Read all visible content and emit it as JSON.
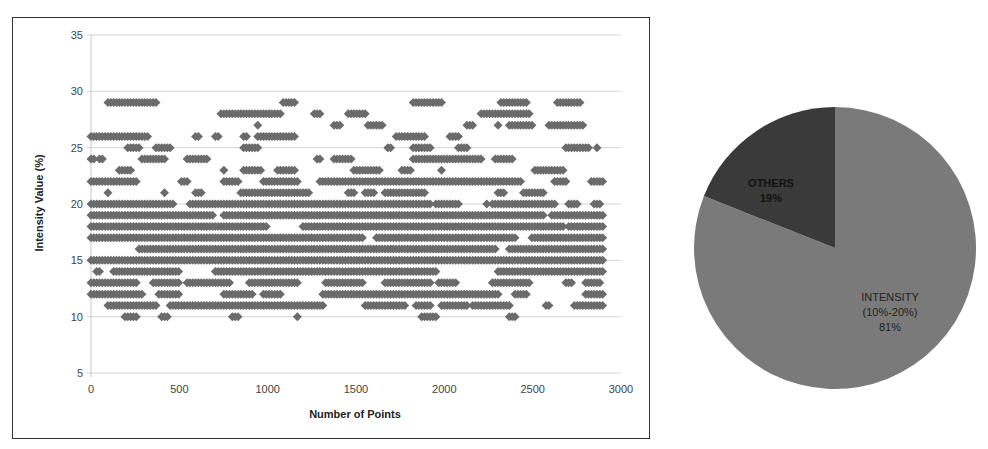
{
  "chart_data": [
    {
      "type": "scatter",
      "title": "",
      "xlabel": "Number of Points",
      "ylabel": "Intensity Value (%)",
      "xlim": [
        0,
        3000
      ],
      "ylim": [
        5,
        35
      ],
      "xticks": [
        "0",
        "500",
        "1000",
        "1500",
        "2000",
        "2500",
        "3000"
      ],
      "yticks": [
        "5",
        "10",
        "15",
        "20",
        "25",
        "30",
        "35"
      ],
      "grid": "horizontal",
      "marker": "diamond",
      "marker_color": "#6b6b6b",
      "series": [
        {
          "name": "Intensity",
          "description": "Integer intensity values (7-30%) for ~2900 points; dense bands 10-20%, sparse 21-30%",
          "rows": [
            {
              "y": 30,
              "density": 0.12,
              "x_range": [
                0,
                2600
              ]
            },
            {
              "y": 29,
              "density": 0.15,
              "x_range": [
                0,
                2850
              ]
            },
            {
              "y": 28,
              "density": 0.2,
              "x_range": [
                0,
                2800
              ]
            },
            {
              "y": 27,
              "density": 0.25,
              "x_range": [
                0,
                2850
              ]
            },
            {
              "y": 26,
              "density": 0.28,
              "x_range": [
                0,
                2800
              ]
            },
            {
              "y": 25,
              "density": 0.25,
              "x_range": [
                0,
                2900
              ]
            },
            {
              "y": 24,
              "density": 0.3,
              "x_range": [
                0,
                2850
              ]
            },
            {
              "y": 23,
              "density": 0.3,
              "x_range": [
                0,
                2850
              ]
            },
            {
              "y": 22,
              "density": 0.35,
              "x_range": [
                0,
                2900
              ]
            },
            {
              "y": 21,
              "density": 0.4,
              "x_range": [
                0,
                2850
              ]
            },
            {
              "y": 20,
              "density": 0.92,
              "x_range": [
                0,
                2900
              ]
            },
            {
              "y": 19,
              "density": 0.92,
              "x_range": [
                0,
                2900
              ]
            },
            {
              "y": 18,
              "density": 0.93,
              "x_range": [
                0,
                2900
              ]
            },
            {
              "y": 17,
              "density": 0.9,
              "x_range": [
                0,
                2900
              ]
            },
            {
              "y": 16,
              "density": 0.95,
              "x_range": [
                0,
                2900
              ]
            },
            {
              "y": 15,
              "density": 0.95,
              "x_range": [
                0,
                2900
              ]
            },
            {
              "y": 14,
              "density": 0.9,
              "x_range": [
                0,
                2900
              ]
            },
            {
              "y": 13,
              "density": 0.75,
              "x_range": [
                0,
                2900
              ]
            },
            {
              "y": 12,
              "density": 0.7,
              "x_range": [
                0,
                2900
              ]
            },
            {
              "y": 11,
              "density": 0.7,
              "x_range": [
                0,
                2900
              ]
            },
            {
              "y": 10,
              "density": 0.25,
              "x_range": [
                0,
                2900
              ]
            },
            {
              "y": 9,
              "density": 0.01,
              "x_range": [
                660,
                680
              ]
            },
            {
              "y": 8,
              "density": 0.01,
              "x_range": [
                660,
                680
              ]
            },
            {
              "y": 7,
              "density": 0.01,
              "x_range": [
                660,
                680
              ]
            }
          ]
        }
      ]
    },
    {
      "type": "pie",
      "title": "",
      "labels": [
        "INTENSITY (10%-20%)",
        "OTHERS"
      ],
      "values": [
        81,
        19
      ],
      "colors": [
        "#7a7a7a",
        "#3a3a3a"
      ],
      "start_angle": "12 o'clock",
      "legend": "none"
    }
  ],
  "scatter": {
    "xlabel": "Number of Points",
    "ylabel": "Intensity Value (%)",
    "xticks": [
      "0",
      "500",
      "1000",
      "1500",
      "2000",
      "2500",
      "3000"
    ],
    "yticks": [
      "5",
      "10",
      "15",
      "20",
      "25",
      "30",
      "35"
    ]
  },
  "pie": {
    "others_label": "OTHERS",
    "others_value": "19%",
    "intensity_label": "INTENSITY",
    "intensity_range": "(10%-20%)",
    "intensity_value": "81%"
  }
}
